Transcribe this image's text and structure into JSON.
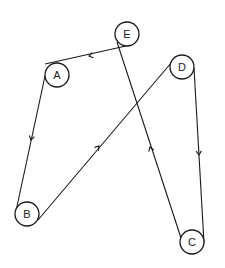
{
  "diagram": {
    "type": "directed-graph",
    "stroke_color": "#1a1a1a",
    "background": "#ffffff",
    "node_radius": 12,
    "nodes": [
      {
        "id": "A",
        "label": "A",
        "cx": 57,
        "cy": 75
      },
      {
        "id": "B",
        "label": "B",
        "cx": 27,
        "cy": 214
      },
      {
        "id": "C",
        "label": "C",
        "cx": 192,
        "cy": 242
      },
      {
        "id": "D",
        "label": "D",
        "cx": 182,
        "cy": 67
      },
      {
        "id": "E",
        "label": "E",
        "cx": 127,
        "cy": 34
      }
    ],
    "edges": [
      {
        "from": "E",
        "to": "A",
        "x1": 126,
        "y1": 46,
        "x2": 45,
        "y2": 64,
        "arrow_x": 89,
        "arrow_y": 56,
        "direction": "left"
      },
      {
        "from": "A",
        "to": "B",
        "x1": 45,
        "y1": 76,
        "x2": 16,
        "y2": 211,
        "arrow_x": 31,
        "arrow_y": 140,
        "direction": "down"
      },
      {
        "from": "B",
        "to": "D",
        "x1": 38,
        "y1": 220,
        "x2": 171,
        "y2": 63,
        "arrow_x": 99,
        "arrow_y": 146,
        "direction": "up-right"
      },
      {
        "from": "D",
        "to": "C",
        "x1": 194,
        "y1": 68,
        "x2": 204,
        "y2": 243,
        "arrow_x": 199,
        "arrow_y": 155,
        "direction": "down"
      },
      {
        "from": "C",
        "to": "E",
        "x1": 181,
        "y1": 238,
        "x2": 117,
        "y2": 42,
        "arrow_x": 150,
        "arrow_y": 147,
        "direction": "up"
      }
    ]
  }
}
